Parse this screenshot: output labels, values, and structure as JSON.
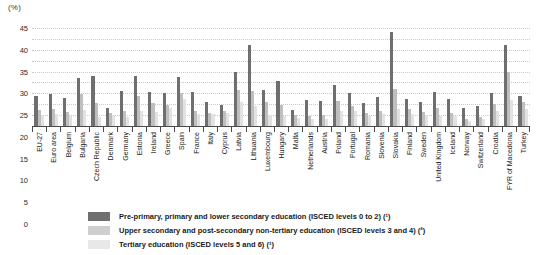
{
  "unit_label": "(%)",
  "legend": {
    "items": [
      {
        "color": "#6f6f6f",
        "label": "Pre-primary, primary and lower secondary education (ISCED levels 0 to 2) (¹)"
      },
      {
        "color": "#cfcfcf",
        "label": "Upper secondary and post-secondary non-tertiary education (ISCED levels 3 and 4) (²)"
      },
      {
        "color": "#e8e8e8",
        "label": "Tertiary education (ISCED levels 5 and 6) (¹)"
      }
    ]
  },
  "chart_data": {
    "type": "bar",
    "title": "",
    "xlabel": "",
    "ylabel": "(%)",
    "ylim": [
      0,
      45
    ],
    "yticks": [
      0,
      5,
      10,
      15,
      20,
      25,
      30,
      35,
      40,
      45
    ],
    "grid": true,
    "legend_position": "bottom",
    "categories": [
      "EU-27",
      "Euro area",
      "Belgium",
      "Bulgaria",
      "Czech Republic",
      "Denmark",
      "Germany",
      "Estonia",
      "Ireland",
      "Greece",
      "Spain",
      "France",
      "Italy",
      "Cyprus",
      "Latvia",
      "Lithuania",
      "Luxembourg",
      "Hungary",
      "Malta",
      "Netherlands",
      "Austria",
      "Poland",
      "Portugal",
      "Romania",
      "Slovenia",
      "Slovakia",
      "Finland",
      "Sweden",
      "United Kingdom",
      "Iceland",
      "Norway",
      "Switzerland",
      "Croatia",
      "FYR of Macedonia",
      "Turkey"
    ],
    "series": [
      {
        "name": "Pre-primary, primary and lower secondary education (ISCED levels 0 to 2) (¹)",
        "color": "#6f6f6f",
        "values": [
          14,
          14.5,
          13,
          22,
          23,
          8.5,
          16,
          23,
          15.5,
          15,
          22.5,
          15.5,
          11,
          9.5,
          25,
          37,
          16.5,
          20.5,
          7.5,
          12,
          11.5,
          19,
          15,
          10.5,
          13.5,
          43,
          12.5,
          11,
          15.5,
          12.5,
          8.5,
          9,
          15,
          37,
          14
        ]
      },
      {
        "name": "Upper secondary and post-secondary non-tertiary education (ISCED levels 3 and 4) (²)",
        "color": "#bfbfbf",
        "values": [
          7.5,
          8,
          6.5,
          14.5,
          10.5,
          6,
          7,
          14,
          10.5,
          9.5,
          15,
          7,
          6,
          7,
          16.5,
          16,
          11,
          9.5,
          5,
          4.5,
          5,
          11.5,
          9,
          6,
          7,
          17,
          8,
          6.5,
          8.5,
          6,
          3,
          4,
          10,
          25,
          11
        ]
      },
      {
        "name": "Tertiary education (ISCED levels 5 and 6) (¹)",
        "color": "#e2e2e2",
        "values": [
          5,
          5.5,
          4.5,
          7.5,
          4,
          5,
          4,
          7,
          6.5,
          8.5,
          12.5,
          5.5,
          5.5,
          6,
          11,
          9,
          5,
          4.5,
          3.5,
          3,
          3,
          7,
          7,
          4.5,
          5.5,
          8,
          5.5,
          5,
          4.5,
          4.5,
          2.5,
          3,
          7,
          12,
          8
        ]
      }
    ]
  }
}
